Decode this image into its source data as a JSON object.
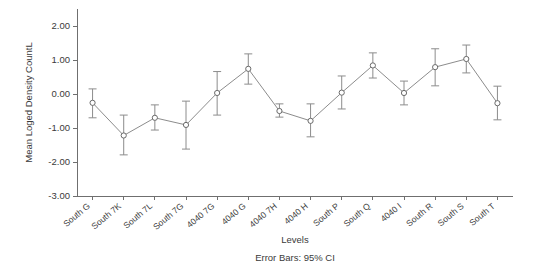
{
  "chart_data": {
    "type": "line",
    "title": "",
    "xlabel": "Levels",
    "ylabel": "Mean Loged Density CountL",
    "caption": "Error Bars: 95% CI",
    "ylim": [
      -3.0,
      2.5
    ],
    "ytick_labels": [
      "2.00",
      "1.00",
      "0.00",
      "-1.00",
      "-2.00",
      "-3.00"
    ],
    "ytick_values": [
      2.0,
      1.0,
      0.0,
      -1.0,
      -2.0,
      -3.0
    ],
    "grid": false,
    "legend": "none",
    "marker": "open-circle",
    "error_bar_type": "95% CI",
    "categories": [
      "South G",
      "South 7K",
      "South 7L",
      "South 7G",
      "4040 7G",
      "4040 G",
      "4040 7H",
      "4040 H",
      "South P",
      "South Q",
      "4040 I",
      "South R",
      "South S",
      "South T"
    ],
    "values": [
      -0.26,
      -1.22,
      -0.7,
      -0.91,
      0.03,
      0.74,
      -0.5,
      -0.79,
      0.04,
      0.84,
      0.03,
      0.79,
      1.03,
      -0.27
    ],
    "ci_lower": [
      -0.7,
      -1.79,
      -1.06,
      -1.62,
      -0.62,
      0.29,
      -0.68,
      -1.26,
      -0.44,
      0.47,
      -0.32,
      0.24,
      0.62,
      -0.76
    ],
    "ci_upper": [
      0.15,
      -0.62,
      -0.32,
      -0.21,
      0.66,
      1.18,
      -0.29,
      -0.29,
      0.53,
      1.21,
      0.38,
      1.33,
      1.44,
      0.23
    ]
  }
}
